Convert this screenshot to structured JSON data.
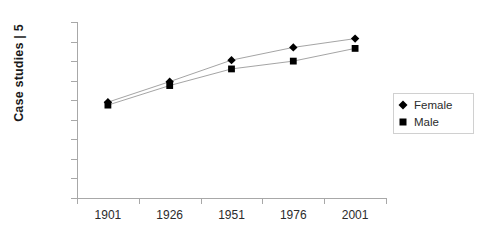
{
  "chart_data": {
    "type": "line",
    "title": "",
    "xlabel": "",
    "ylabel": "Case studies | 5",
    "categories": [
      "1901",
      "1926",
      "1951",
      "1976",
      "2001"
    ],
    "x": [
      1901,
      1926,
      1951,
      1976,
      2001
    ],
    "series": [
      {
        "name": "Female",
        "marker": "diamond",
        "color": "#000000",
        "values": [
          49,
          59.5,
          70.5,
          77,
          81.5
        ]
      },
      {
        "name": "Male",
        "marker": "square",
        "color": "#000000",
        "values": [
          47.5,
          57.5,
          66,
          70,
          76.5
        ]
      }
    ],
    "ylim": [
      0,
      90
    ],
    "ytick_labels": [
      "90",
      "80",
      "70",
      "60",
      "50",
      "40",
      "30",
      "20",
      "10",
      "0"
    ],
    "ytick_values": [
      90,
      80,
      70,
      60,
      50,
      40,
      30,
      20,
      10,
      0
    ],
    "grid": false,
    "legend_position": "right"
  },
  "legend": {
    "entries": [
      {
        "label": "Female",
        "marker": "diamond-marker-icon"
      },
      {
        "label": "Male",
        "marker": "square-marker-icon"
      }
    ]
  },
  "colors": {
    "axis": "#a8a8a8",
    "line": "#9a9a9a",
    "marker": "#000000",
    "text": "#2b2b2b",
    "title_text": "#1a1a1a",
    "legend_border": "#d0d0d0",
    "background": "#ffffff"
  }
}
